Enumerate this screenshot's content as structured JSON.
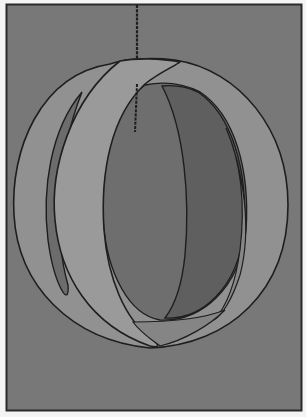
{
  "figure": {
    "subject": "Hanging sphere made of intersecting curved bands suspended from a string",
    "style": "grayscale illustration",
    "colors": {
      "page": "#f4f4f4",
      "frame_border": "#2a2a2a",
      "background": "#787878",
      "band_light": "#959595",
      "band_mid": "#8a8a8a",
      "interior": "#6e6e6e",
      "interior_dark": "#5e5e5e",
      "outline": "#1e1e1e"
    },
    "parts": [
      "string",
      "string-anchor",
      "outer-ring-band",
      "front-vertical-band",
      "rear-vertical-band",
      "interior"
    ]
  }
}
